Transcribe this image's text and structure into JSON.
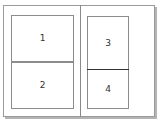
{
  "diagram": {
    "type": "page-layout",
    "spread": {
      "left_page": {
        "panels": [
          {
            "id": 1,
            "label": "1"
          },
          {
            "id": 2,
            "label": "2"
          }
        ]
      },
      "right_page": {
        "panels": [
          {
            "id": 3,
            "label": "3"
          },
          {
            "id": 4,
            "label": "4"
          }
        ]
      }
    },
    "colors": {
      "border": "#8c8c8c",
      "divider": "#333333",
      "background": "#ffffff",
      "shadow": "#b4b4b4"
    }
  }
}
